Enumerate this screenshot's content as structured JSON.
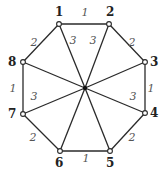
{
  "diagram": {
    "hub": {
      "x": 85,
      "y": 88
    },
    "nodes": [
      {
        "id": "1",
        "x": 59,
        "y": 24,
        "lx": 55,
        "ly": 16
      },
      {
        "id": "2",
        "x": 109,
        "y": 24,
        "lx": 106,
        "ly": 16
      },
      {
        "id": "3",
        "x": 145,
        "y": 62,
        "lx": 150,
        "ly": 66
      },
      {
        "id": "4",
        "x": 145,
        "y": 113,
        "lx": 150,
        "ly": 117
      },
      {
        "id": "5",
        "x": 110,
        "y": 151,
        "lx": 106,
        "ly": 167
      },
      {
        "id": "6",
        "x": 60,
        "y": 151,
        "lx": 55,
        "ly": 167
      },
      {
        "id": "7",
        "x": 23,
        "y": 114,
        "lx": 8,
        "ly": 118
      },
      {
        "id": "8",
        "x": 23,
        "y": 62,
        "lx": 8,
        "ly": 66
      }
    ],
    "rim_edges": [
      {
        "from": 0,
        "to": 1,
        "label": "1",
        "lx": 85,
        "ly": 16
      },
      {
        "from": 1,
        "to": 2,
        "label": "2",
        "lx": 132,
        "ly": 46
      },
      {
        "from": 2,
        "to": 3,
        "label": "1",
        "lx": 151,
        "ly": 92
      },
      {
        "from": 3,
        "to": 4,
        "label": "2",
        "lx": 132,
        "ly": 141
      },
      {
        "from": 4,
        "to": 5,
        "label": "1",
        "lx": 86,
        "ly": 162
      },
      {
        "from": 5,
        "to": 6,
        "label": "2",
        "lx": 33,
        "ly": 141
      },
      {
        "from": 6,
        "to": 7,
        "label": "1",
        "lx": 13,
        "ly": 92
      },
      {
        "from": 7,
        "to": 0,
        "label": "2",
        "lx": 34,
        "ly": 46
      }
    ],
    "spoke_labels": [
      {
        "label": "3",
        "lx": 73,
        "ly": 44
      },
      {
        "label": "3",
        "lx": 93,
        "ly": 44
      },
      {
        "label": "3",
        "lx": 133,
        "ly": 100
      },
      {
        "label": "3",
        "lx": 34,
        "ly": 100
      }
    ]
  }
}
